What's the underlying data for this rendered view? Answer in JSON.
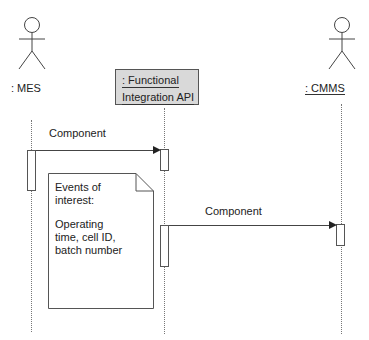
{
  "diagram": {
    "type": "uml-sequence",
    "participants": [
      {
        "id": "mes",
        "label": ": MES",
        "kind": "actor",
        "underlined": false
      },
      {
        "id": "fia",
        "label_line1": ": Functional",
        "label_line2": "Integration API",
        "kind": "object",
        "underlined": true
      },
      {
        "id": "cmms",
        "label": ": CMMS",
        "kind": "actor",
        "underlined": true
      }
    ],
    "messages": [
      {
        "from": "mes",
        "to": "fia",
        "label": "Component"
      },
      {
        "from": "fia",
        "to": "cmms",
        "label": "Component"
      }
    ],
    "note": {
      "line1": "Events of",
      "line2": "interest:",
      "line3": "Operating",
      "line4": "time, cell ID,",
      "line5": "batch number"
    },
    "colors": {
      "object_fill": "#d9d9d9",
      "line": "#444444"
    }
  }
}
